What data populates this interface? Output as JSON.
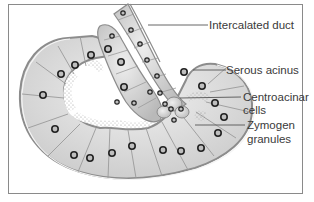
{
  "diagram": {
    "labels": [
      {
        "id": "intercalated-duct",
        "text": "Intercalated duct"
      },
      {
        "id": "serous-acinus",
        "text": "Serous acinus"
      },
      {
        "id": "centroacinar-cells",
        "line1": "Centroacinar",
        "line2": "cells"
      },
      {
        "id": "zymogen-granules",
        "line1": "Zymogen",
        "line2": "granules"
      }
    ],
    "colors": {
      "cell_fill": "#d8d8d8",
      "cell_light": "#ececec",
      "outline": "#8c8c8c",
      "nucleus_ring": "#2a2a2a",
      "text": "#3a3a3a",
      "leader_line": "#555555"
    }
  }
}
